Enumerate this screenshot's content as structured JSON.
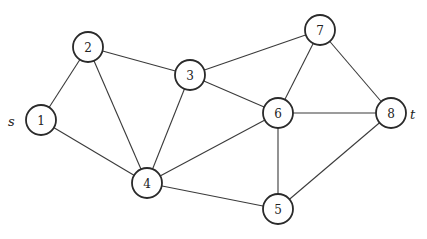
{
  "graph": {
    "nodes": [
      {
        "id": "1",
        "label": "1",
        "x": 41,
        "y": 120,
        "tag": "s"
      },
      {
        "id": "2",
        "label": "2",
        "x": 88,
        "y": 47
      },
      {
        "id": "3",
        "label": "3",
        "x": 190,
        "y": 75
      },
      {
        "id": "4",
        "label": "4",
        "x": 147,
        "y": 183
      },
      {
        "id": "5",
        "label": "5",
        "x": 278,
        "y": 209
      },
      {
        "id": "6",
        "label": "6",
        "x": 278,
        "y": 113
      },
      {
        "id": "7",
        "label": "7",
        "x": 320,
        "y": 30
      },
      {
        "id": "8",
        "label": "8",
        "x": 391,
        "y": 113,
        "tag": "t"
      }
    ],
    "edges": [
      [
        "1",
        "2"
      ],
      [
        "1",
        "4"
      ],
      [
        "2",
        "3"
      ],
      [
        "2",
        "4"
      ],
      [
        "3",
        "4"
      ],
      [
        "3",
        "6"
      ],
      [
        "3",
        "7"
      ],
      [
        "4",
        "6"
      ],
      [
        "4",
        "5"
      ],
      [
        "6",
        "7"
      ],
      [
        "6",
        "8"
      ],
      [
        "6",
        "5"
      ],
      [
        "7",
        "8"
      ],
      [
        "5",
        "8"
      ]
    ],
    "source_label": "s",
    "sink_label": "t"
  }
}
